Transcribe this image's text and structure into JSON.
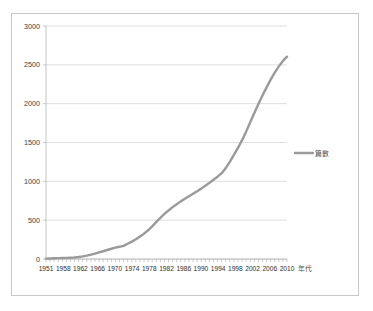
{
  "chart_data": {
    "type": "line",
    "title": "",
    "xlabel": "年代",
    "ylabel": "",
    "legend": [
      "篇數"
    ],
    "legend_position": "right",
    "grid": true,
    "ylim": [
      0,
      3000
    ],
    "yticks": [
      0,
      500,
      1000,
      1500,
      2000,
      2500,
      3000
    ],
    "ytick_labels": [
      "0",
      "500",
      "1000",
      "1500",
      "2000",
      "2500",
      "3000"
    ],
    "xlim": [
      1951,
      2010
    ],
    "xtick_labels": [
      "1951",
      "1958",
      "1962",
      "1966",
      "1970",
      "1974",
      "1978",
      "1982",
      "1986",
      "1990",
      "1994",
      "1998",
      "2002",
      "2006",
      "2010"
    ],
    "line_color": "#9a9a9a",
    "series": [
      {
        "name": "篇數",
        "x": [
          1951,
          1952,
          1953,
          1954,
          1955,
          1956,
          1957,
          1958,
          1959,
          1960,
          1961,
          1962,
          1963,
          1964,
          1965,
          1966,
          1967,
          1968,
          1969,
          1970,
          1971,
          1972,
          1973,
          1974,
          1975,
          1976,
          1977,
          1978,
          1979,
          1980,
          1981,
          1982,
          1983,
          1984,
          1985,
          1986,
          1987,
          1988,
          1989,
          1990,
          1991,
          1992,
          1993,
          1994,
          1995,
          1996,
          1997,
          1998,
          1999,
          2000,
          2001,
          2002,
          2003,
          2004,
          2005,
          2006,
          2007,
          2008,
          2009,
          2010
        ],
        "values": [
          5,
          7,
          9,
          11,
          13,
          15,
          17,
          20,
          26,
          34,
          44,
          56,
          70,
          85,
          100,
          116,
          132,
          146,
          158,
          170,
          196,
          224,
          254,
          288,
          326,
          370,
          420,
          478,
          530,
          580,
          625,
          668,
          706,
          742,
          775,
          808,
          840,
          872,
          906,
          942,
          980,
          1020,
          1060,
          1105,
          1170,
          1250,
          1340,
          1430,
          1530,
          1640,
          1760,
          1880,
          1995,
          2105,
          2210,
          2310,
          2400,
          2480,
          2550,
          2605
        ]
      }
    ]
  },
  "legend_entry": {
    "label": "篇數"
  },
  "axis": {
    "x_title": "年代"
  }
}
